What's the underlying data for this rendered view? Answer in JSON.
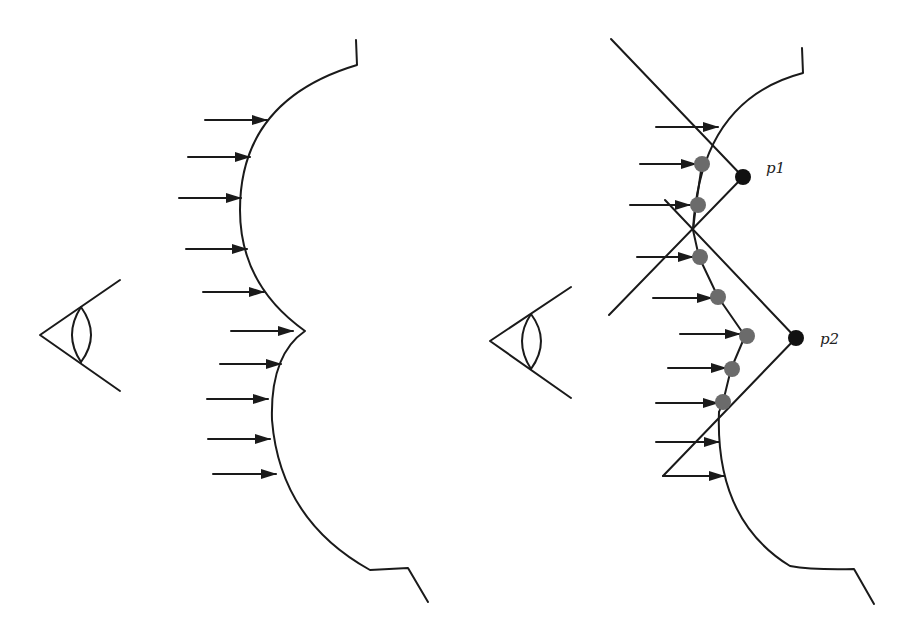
{
  "figure": {
    "panels": [
      {
        "id": "left",
        "description": "Eye viewing a concave two-lobed surface with incident arrows",
        "eye": {
          "x": 40,
          "y": 335
        },
        "arrows_y": [
          120,
          157,
          198,
          249,
          292,
          331,
          363,
          399,
          439,
          474
        ],
        "labels": []
      },
      {
        "id": "right",
        "description": "Eye viewing surface with sampled points and reflected construction lines meeting at p1 and p2",
        "eye": {
          "x": 490,
          "y": 341
        },
        "labels": [
          {
            "text": "p1",
            "x": 766,
            "y": 173
          },
          {
            "text": "p2",
            "x": 820,
            "y": 343
          }
        ],
        "points": {
          "p1": {
            "x": 743,
            "y": 177,
            "color": "#111111"
          },
          "p2": {
            "x": 796,
            "y": 338,
            "color": "#111111"
          }
        },
        "sample_points_color": "#6b6b6b"
      }
    ],
    "colors": {
      "stroke": "#1a1a1a",
      "sample_point": "#6b6b6b",
      "key_point": "#111111",
      "background": "#ffffff"
    }
  }
}
